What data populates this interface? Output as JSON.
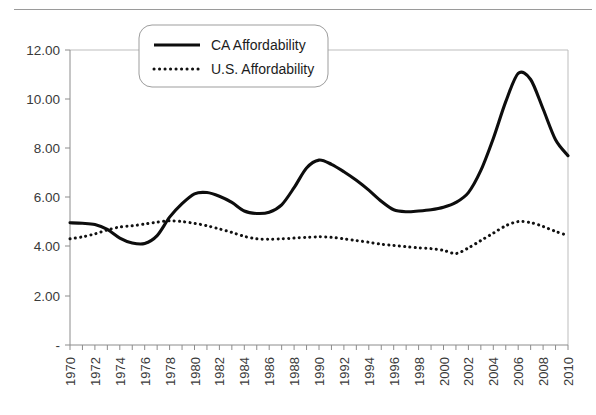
{
  "chart_data": {
    "type": "line",
    "title": "",
    "subtitle": "",
    "xlabel": "",
    "ylabel": "",
    "xlim": [
      1970,
      2010
    ],
    "ylim": [
      0,
      12
    ],
    "grid": false,
    "legend_position": "top-center",
    "y_ticks": [
      "-",
      "2.00",
      "4.00",
      "6.00",
      "8.00",
      "10.00",
      "12.00"
    ],
    "y_tick_values": [
      0,
      2,
      4,
      6,
      8,
      10,
      12
    ],
    "x_tick_labels": [
      "1970",
      "1972",
      "1974",
      "1976",
      "1978",
      "1980",
      "1982",
      "1984",
      "1986",
      "1988",
      "1990",
      "1992",
      "1994",
      "1996",
      "1998",
      "2000",
      "2002",
      "2004",
      "2006",
      "2008",
      "2010"
    ],
    "x": [
      1970,
      1971,
      1972,
      1973,
      1974,
      1975,
      1976,
      1977,
      1978,
      1979,
      1980,
      1981,
      1982,
      1983,
      1984,
      1985,
      1986,
      1987,
      1988,
      1989,
      1990,
      1991,
      1992,
      1993,
      1994,
      1995,
      1996,
      1997,
      1998,
      1999,
      2000,
      2001,
      2002,
      2003,
      2004,
      2005,
      2006,
      2007,
      2008,
      2009,
      2010
    ],
    "series": [
      {
        "name": "CA Affordability",
        "style": "solid",
        "color": "#0d0d0d",
        "values": [
          4.97,
          4.95,
          4.9,
          4.7,
          4.35,
          4.15,
          4.13,
          4.45,
          5.2,
          5.75,
          6.15,
          6.2,
          6.05,
          5.8,
          5.45,
          5.35,
          5.4,
          5.7,
          6.4,
          7.2,
          7.52,
          7.35,
          7.05,
          6.7,
          6.3,
          5.85,
          5.5,
          5.42,
          5.45,
          5.5,
          5.6,
          5.8,
          6.2,
          7.1,
          8.4,
          9.9,
          11.05,
          10.8,
          9.6,
          8.35,
          7.7
        ]
      },
      {
        "name": "U.S. Affordability",
        "style": "dotted",
        "color": "#111111",
        "values": [
          4.32,
          4.4,
          4.52,
          4.68,
          4.8,
          4.85,
          4.92,
          5.0,
          5.05,
          5.02,
          4.95,
          4.85,
          4.72,
          4.58,
          4.42,
          4.32,
          4.3,
          4.32,
          4.35,
          4.38,
          4.4,
          4.38,
          4.32,
          4.25,
          4.18,
          4.1,
          4.05,
          4.0,
          3.95,
          3.92,
          3.85,
          3.72,
          3.95,
          4.25,
          4.55,
          4.85,
          5.02,
          4.98,
          4.82,
          4.62,
          4.45
        ]
      }
    ],
    "annotations": []
  },
  "legend": {
    "items": [
      {
        "label": "CA Affordability",
        "style": "solid"
      },
      {
        "label": "U.S. Affordability",
        "style": "dotted"
      }
    ]
  }
}
